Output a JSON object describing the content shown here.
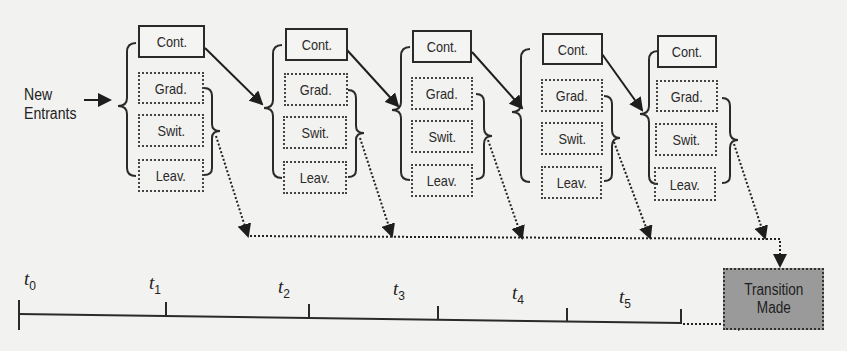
{
  "diagram": {
    "entry_label": "New\nEntrants",
    "groups": [
      {
        "cont": "Cont.",
        "grad": "Grad.",
        "swit": "Swit.",
        "leav": "Leav."
      },
      {
        "cont": "Cont.",
        "grad": "Grad.",
        "swit": "Swit.",
        "leav": "Leav."
      },
      {
        "cont": "Cont.",
        "grad": "Grad.",
        "swit": "Swit.",
        "leav": "Leav."
      },
      {
        "cont": "Cont.",
        "grad": "Grad.",
        "swit": "Swit.",
        "leav": "Leav."
      },
      {
        "cont": "Cont.",
        "grad": "Grad.",
        "swit": "Swit.",
        "leav": "Leav."
      },
      {
        "cont": "Cont.",
        "grad": "Grad.",
        "swit": "Swit.",
        "leav": "Leav."
      }
    ],
    "outcome": "Transition\nMade",
    "timeline": [
      {
        "t": "t",
        "sub": "0"
      },
      {
        "t": "t",
        "sub": "1"
      },
      {
        "t": "t",
        "sub": "2"
      },
      {
        "t": "t",
        "sub": "3"
      },
      {
        "t": "t",
        "sub": "4"
      },
      {
        "t": "t",
        "sub": "5"
      }
    ],
    "colors": {
      "outcome_fill": "#9a9a9a",
      "line": "#2a2a2a",
      "background": "#f2f2f0"
    }
  }
}
